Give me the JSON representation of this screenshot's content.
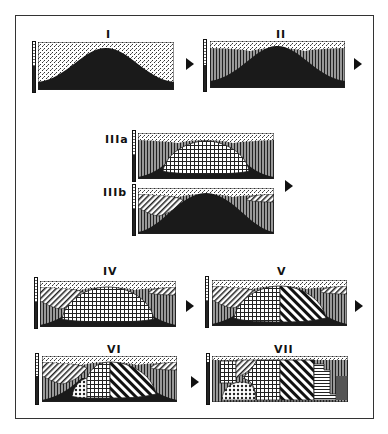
{
  "figure": {
    "type": "geological cross-section sequence",
    "panels": [
      {
        "id": "I",
        "label": "I",
        "units": [
          "stipple cover",
          "solid dark dome"
        ]
      },
      {
        "id": "II",
        "label": "II",
        "units": [
          "stipple cover",
          "vertical-lined flanks",
          "solid dark dome"
        ]
      },
      {
        "id": "IIIa",
        "label": "IIIa",
        "units": [
          "stipple cover",
          "vertical-lined flanks",
          "grid-hatched core",
          "solid dark base"
        ]
      },
      {
        "id": "IIIb",
        "label": "IIIb",
        "units": [
          "stipple cover",
          "diagonal-hatched wedges",
          "vertical-lined flanks",
          "solid dark dome"
        ]
      },
      {
        "id": "IV",
        "label": "IV",
        "units": [
          "stipple cover",
          "diagonal-hatched wedges",
          "vertical-lined flanks",
          "grid-hatched core",
          "solid dark base"
        ]
      },
      {
        "id": "V",
        "label": "V",
        "units": [
          "stipple cover",
          "diagonal-hatched wedges",
          "vertical-lined flanks",
          "grid-hatched core",
          "bold diagonal core",
          "solid dark base"
        ]
      },
      {
        "id": "VI",
        "label": "VI",
        "units": [
          "stipple cover",
          "diagonal-hatched wedges",
          "vertical-lined flanks",
          "dotted lens",
          "grid-hatched core",
          "bold diagonal core",
          "solid dark base"
        ]
      },
      {
        "id": "VII",
        "label": "VII",
        "units": [
          "stipple cover",
          "blocky grid",
          "dotted lens",
          "grid-hatched core",
          "bold diagonal core",
          "horizontal-lined block",
          "vertical-lined flanks"
        ]
      }
    ],
    "arrows": [
      "I→II",
      "II→III",
      "III→IV",
      "IV→V",
      "V→VI",
      "VI→VII",
      "II→",
      "V→"
    ]
  },
  "colors": {
    "dark": "#1a1a1a",
    "line": "#333333",
    "background": "#ffffff"
  }
}
